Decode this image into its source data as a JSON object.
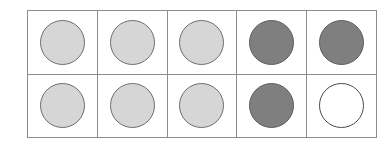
{
  "diagram": {
    "type": "circle-grid",
    "rows": 2,
    "columns": 5,
    "colors": {
      "light_fill": "#d6d6d6",
      "dark_fill": "#7f7f7f",
      "empty_fill": "#ffffff",
      "outline": "#6e6e6e",
      "grid_line": "#8c8c8c",
      "background": "#ffffff"
    },
    "legend": {
      "light": "light-gray-filled-circle",
      "dark": "dark-gray-filled-circle",
      "empty": "white-unfilled-circle"
    },
    "cells": [
      [
        {
          "shape": "circle",
          "shade": "light"
        },
        {
          "shape": "circle",
          "shade": "light"
        },
        {
          "shape": "circle",
          "shade": "light"
        },
        {
          "shape": "circle",
          "shade": "dark"
        },
        {
          "shape": "circle",
          "shade": "dark"
        }
      ],
      [
        {
          "shape": "circle",
          "shade": "light"
        },
        {
          "shape": "circle",
          "shade": "light"
        },
        {
          "shape": "circle",
          "shade": "light"
        },
        {
          "shape": "circle",
          "shade": "dark"
        },
        {
          "shape": "circle",
          "shade": "empty"
        }
      ]
    ]
  }
}
